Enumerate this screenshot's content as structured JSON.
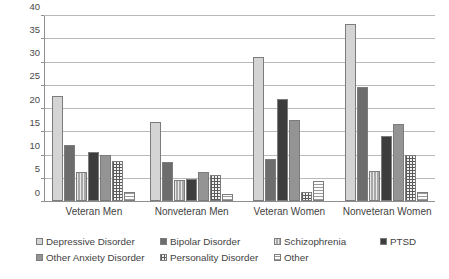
{
  "chart_data": {
    "type": "bar",
    "title": "",
    "xlabel": "",
    "ylabel": "",
    "ylim": [
      0,
      40
    ],
    "y_ticks": [
      0,
      5,
      10,
      15,
      20,
      25,
      30,
      35,
      40
    ],
    "grid": true,
    "legend_position": "bottom",
    "categories": [
      "Veteran Men",
      "Nonveteran Men",
      "Veteran Women",
      "Nonveteran Women"
    ],
    "series": [
      {
        "name": "Depressive Disorder",
        "fill": "solid-light-gray",
        "color": "#d4d4d4",
        "values": [
          22.5,
          17.0,
          31.0,
          38.0
        ]
      },
      {
        "name": "Bipolar Disorder",
        "fill": "solid-dark-gray",
        "color": "#6d6d6d",
        "values": [
          12.0,
          8.3,
          9.1,
          24.5
        ]
      },
      {
        "name": "Schizophrenia",
        "fill": "vertical-lines",
        "color": "#a8a8a8",
        "values": [
          6.2,
          4.6,
          0.0,
          6.5
        ]
      },
      {
        "name": "PTSD",
        "fill": "solid-black",
        "color": "#3d3d3d",
        "values": [
          10.5,
          4.7,
          22.0,
          14.0
        ]
      },
      {
        "name": "Other Anxiety Disorder",
        "fill": "solid-medium-gray",
        "color": "#949494",
        "values": [
          10.0,
          6.3,
          17.5,
          16.5
        ]
      },
      {
        "name": "Personality Disorder",
        "fill": "checkered",
        "color": "#5a5a5a",
        "values": [
          8.5,
          5.7,
          2.0,
          10.0
        ]
      },
      {
        "name": "Other",
        "fill": "horizontal-lines",
        "color": "#9a9a9a",
        "values": [
          2.0,
          1.5,
          4.2,
          2.0
        ]
      }
    ]
  },
  "axis": {
    "tick_0": "0",
    "tick_1": "5",
    "tick_2": "10",
    "tick_3": "15",
    "tick_4": "20",
    "tick_5": "25",
    "tick_6": "30",
    "tick_7": "35",
    "tick_8": "40"
  },
  "categories": {
    "c0": "Veteran Men",
    "c1": "Nonveteran Men",
    "c2": "Veteran Women",
    "c3": "Nonveteran Women"
  },
  "legend": {
    "l0": "Depressive Disorder",
    "l1": "Bipolar Disorder",
    "l2": "Schizophrenia",
    "l3": "PTSD",
    "l4": "Other Anxiety Disorder",
    "l5": "Personality Disorder",
    "l6": "Other"
  }
}
